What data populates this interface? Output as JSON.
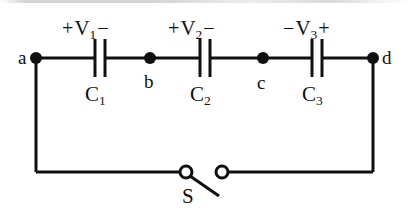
{
  "figure": {
    "background_color": "#ffffff",
    "ink_color": "#101010",
    "width": 408,
    "height": 215
  },
  "nodes": [
    {
      "id": "a",
      "label": "a",
      "x": 36,
      "y": 58,
      "label_x": 18,
      "label_y": 48
    },
    {
      "id": "b",
      "label": "b",
      "x": 150,
      "y": 58,
      "label_x": 144,
      "label_y": 72
    },
    {
      "id": "c",
      "label": "c",
      "x": 263,
      "y": 58,
      "label_x": 257,
      "label_y": 73
    },
    {
      "id": "d",
      "label": "d",
      "x": 373,
      "y": 58,
      "label_x": 382,
      "label_y": 48
    }
  ],
  "capacitors": [
    {
      "id": "C1",
      "name": "C",
      "subscript": "1",
      "x": 100,
      "y": 58,
      "voltage_name": "V",
      "voltage_subscript": "1",
      "left_polarity": "+",
      "right_polarity": "−",
      "voltage_label_x": 62,
      "voltage_label_y": 18,
      "cap_label_x": 85,
      "cap_label_y": 84
    },
    {
      "id": "C2",
      "name": "C",
      "subscript": "2",
      "x": 205,
      "y": 58,
      "voltage_name": "V",
      "voltage_subscript": "2",
      "left_polarity": "+",
      "right_polarity": "−",
      "voltage_label_x": 168,
      "voltage_label_y": 18,
      "cap_label_x": 190,
      "cap_label_y": 84
    },
    {
      "id": "C3",
      "name": "C",
      "subscript": "3",
      "x": 317,
      "y": 58,
      "voltage_name": "V",
      "voltage_subscript": "3",
      "left_polarity": "−",
      "right_polarity": "+",
      "voltage_label_x": 283,
      "voltage_label_y": 18,
      "cap_label_x": 302,
      "cap_label_y": 84
    }
  ],
  "switch": {
    "label": "S",
    "state": "open",
    "left_terminal_x": 186,
    "right_terminal_x": 222,
    "y": 172,
    "terminal_radius": 6,
    "lever_end_x": 219,
    "lever_end_y": 196,
    "label_x": 182,
    "label_y": 186
  },
  "wires": {
    "top_y": 58,
    "bottom_y": 172,
    "left_x": 36,
    "right_x": 373,
    "stroke_width": 3
  }
}
